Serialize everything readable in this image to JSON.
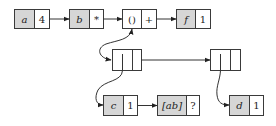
{
  "diagram": {
    "type": "linked-structure",
    "colors": {
      "shaded": "#d6d6d6",
      "border": "#3a3a3a",
      "background": "#ffffff"
    },
    "top_row": [
      {
        "key": "a",
        "value": "4"
      },
      {
        "key": "b",
        "value": "*"
      },
      {
        "key": "()",
        "value": "+"
      },
      {
        "key": "f",
        "value": "1"
      }
    ],
    "pairs": [
      {
        "id": "pair-left"
      },
      {
        "id": "pair-right"
      }
    ],
    "bottom_row": [
      {
        "key": "c",
        "value": "1"
      },
      {
        "key": "[ab]",
        "value": "?"
      },
      {
        "key": "d",
        "value": "1"
      }
    ]
  }
}
